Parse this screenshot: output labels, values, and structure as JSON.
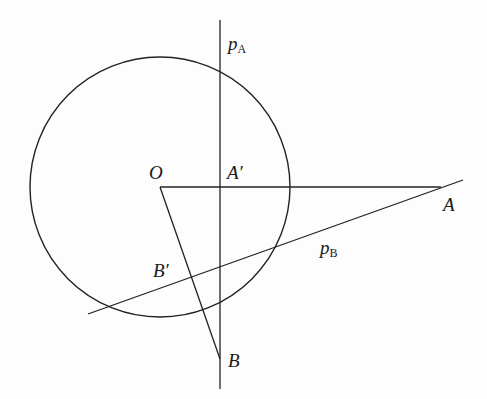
{
  "diagram": {
    "type": "geometry",
    "stroke_color": "#222222",
    "circle": {
      "center": "O",
      "cx": 160,
      "cy": 187,
      "r": 130
    },
    "points": {
      "O": {
        "x": 160,
        "y": 187,
        "label": "O"
      },
      "A": {
        "x": 441,
        "y": 187,
        "label": "A"
      },
      "A_prime": {
        "x": 220,
        "y": 187,
        "label": "A′"
      },
      "B": {
        "x": 220,
        "y": 359,
        "label": "B"
      },
      "B_prime": {
        "x": 191,
        "y": 277,
        "label": "B′"
      }
    },
    "lines": {
      "p_A": {
        "label_main": "p",
        "label_sub": "A",
        "x1": 220,
        "y1": 20,
        "x2": 220,
        "y2": 389
      },
      "p_B": {
        "label_main": "p",
        "label_sub": "B",
        "x1": 88,
        "y1": 314,
        "x2": 463,
        "y2": 180
      },
      "OA": {
        "x1": 160,
        "y1": 187,
        "x2": 441,
        "y2": 187
      },
      "OB": {
        "x1": 160,
        "y1": 187,
        "x2": 220,
        "y2": 359
      }
    }
  }
}
